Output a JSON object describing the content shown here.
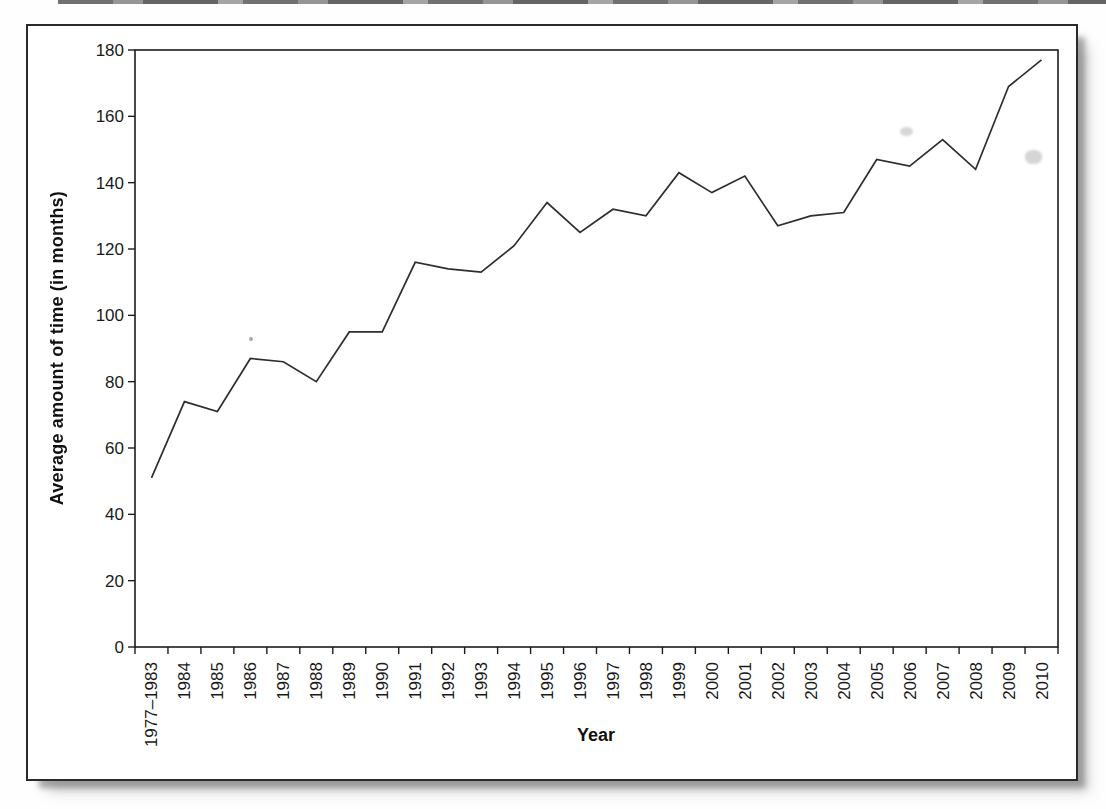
{
  "page": {
    "background_color": "#fefefe",
    "panel_border_color": "#2a2a2a",
    "panel_background": "#ffffff"
  },
  "chart_data": {
    "type": "line",
    "title": "",
    "xlabel": "Year",
    "ylabel": "Average amount of time (in months)",
    "categories": [
      "1977–1983",
      "1984",
      "1985",
      "1986",
      "1987",
      "1988",
      "1989",
      "1990",
      "1991",
      "1992",
      "1993",
      "1994",
      "1995",
      "1996",
      "1997",
      "1998",
      "1999",
      "2000",
      "2001",
      "2002",
      "2003",
      "2004",
      "2005",
      "2006",
      "2007",
      "2008",
      "2009",
      "2010"
    ],
    "values": [
      51,
      74,
      71,
      87,
      86,
      80,
      95,
      95,
      116,
      114,
      113,
      121,
      134,
      125,
      132,
      130,
      143,
      137,
      142,
      127,
      130,
      131,
      147,
      145,
      153,
      144,
      169,
      177
    ],
    "ylim": [
      0,
      180
    ],
    "yticks": [
      0,
      20,
      40,
      60,
      80,
      100,
      120,
      140,
      160,
      180
    ],
    "grid": false,
    "legend": "none",
    "line_color": "#2e2e2e",
    "axis_color": "#1c1c1c",
    "tick_label_color": "#1a1a1a"
  }
}
